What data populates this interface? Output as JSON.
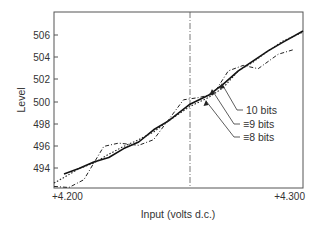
{
  "chart_data": {
    "type": "line",
    "title": "",
    "xlabel": "Input (volts d.c.)",
    "ylabel": "Level",
    "xlim": [
      4.2,
      4.3
    ],
    "ylim": [
      492.2,
      508.1
    ],
    "x_tick_labels": [
      "+4.200",
      "+4.300"
    ],
    "x_ticks": [
      4.2,
      4.3
    ],
    "y_ticks": [
      494,
      496,
      498,
      500,
      502,
      504,
      506
    ],
    "y_tick_labels": [
      "494",
      "496",
      "498",
      "500",
      "502",
      "504",
      "506"
    ],
    "grid": false,
    "legend": "annotations with arrows (right-center)",
    "reference_line": {
      "type": "vertical",
      "style": "dash-dot",
      "x": 4.2546
    },
    "series": [
      {
        "name": "10 bits",
        "style": "solid",
        "x": [
          4.204,
          4.21,
          4.216,
          4.222,
          4.228,
          4.234,
          4.24,
          4.246,
          4.2546,
          4.262,
          4.268,
          4.274,
          4.28,
          4.286,
          4.292,
          4.3
        ],
        "values": [
          493.5,
          494.0,
          494.6,
          495.0,
          495.8,
          496.4,
          497.5,
          498.3,
          499.8,
          500.6,
          501.6,
          502.8,
          503.7,
          504.6,
          505.4,
          506.4
        ]
      },
      {
        "name": "≡9 bits",
        "style": "dotted",
        "x": [
          4.2,
          4.204,
          4.21,
          4.216,
          4.222,
          4.228,
          4.234,
          4.24,
          4.246,
          4.2546,
          4.262,
          4.268,
          4.274,
          4.28,
          4.286,
          4.292,
          4.3
        ],
        "values": [
          492.7,
          493.2,
          494.0,
          494.5,
          495.3,
          496.0,
          496.6,
          497.3,
          498.3,
          499.6,
          500.4,
          501.3,
          502.8,
          503.6,
          504.6,
          505.5,
          506.3
        ]
      },
      {
        "name": "≡8 bits",
        "style": "dash-dot",
        "x": [
          4.2,
          4.206,
          4.212,
          4.216,
          4.22,
          4.226,
          4.234,
          4.24,
          4.246,
          4.252,
          4.258,
          4.264,
          4.27,
          4.276,
          4.282,
          4.29,
          4.296
        ],
        "values": [
          492.4,
          492.3,
          493.0,
          494.5,
          496.0,
          496.3,
          496.1,
          496.6,
          498.4,
          500.2,
          500.4,
          500.7,
          502.8,
          503.3,
          503.0,
          504.3,
          504.7
        ]
      }
    ],
    "annotations": [
      {
        "text": "10 bits",
        "points_to_series": "10 bits"
      },
      {
        "text": "≡9 bits",
        "points_to_series": "≡9 bits"
      },
      {
        "text": "≡8 bits",
        "points_to_series": "≡8 bits"
      }
    ]
  },
  "labels": {
    "y_axis": "Level",
    "x_axis": "Input (volts d.c.)",
    "x_min": "+4.200",
    "x_max": "+4.300",
    "ann_10": "10 bits",
    "ann_9": "≡9 bits",
    "ann_8": "≡8 bits",
    "y_506": "506",
    "y_504": "504",
    "y_502": "502",
    "y_500": "500",
    "y_498": "498",
    "y_496": "496",
    "y_494": "494"
  }
}
